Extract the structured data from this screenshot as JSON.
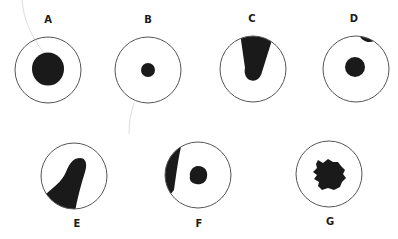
{
  "figure": {
    "colors": {
      "outline": "#555555",
      "fill": "#1a1a1a",
      "fiber": "#c8c8c8",
      "background": "#ffffff"
    },
    "panels": [
      {
        "label": "A",
        "cx": 48,
        "cy": 70,
        "r": 33,
        "label_x": 48,
        "label_y": 20,
        "feature": "large central nucleus"
      },
      {
        "label": "B",
        "cx": 148,
        "cy": 70,
        "r": 33,
        "label_x": 148,
        "label_y": 20,
        "feature": "small central nucleus"
      },
      {
        "label": "C",
        "cx": 253,
        "cy": 69,
        "r": 33,
        "label_x": 252,
        "label_y": 19,
        "feature": "wedge shape from top edge"
      },
      {
        "label": "D",
        "cx": 356,
        "cy": 69,
        "r": 33,
        "label_x": 354,
        "label_y": 19,
        "feature": "central nucleus with small blob at top edge"
      },
      {
        "label": "E",
        "cx": 74,
        "cy": 176,
        "r": 33,
        "label_x": 77,
        "label_y": 224,
        "feature": "large shape from lower-left edge"
      },
      {
        "label": "F",
        "cx": 198,
        "cy": 175,
        "r": 33,
        "label_x": 199,
        "label_y": 224,
        "feature": "central nucleus with crescent on left edge"
      },
      {
        "label": "G",
        "cx": 329,
        "cy": 174,
        "r": 33,
        "label_x": 330,
        "label_y": 222,
        "feature": "irregular ragged central mass"
      }
    ]
  }
}
